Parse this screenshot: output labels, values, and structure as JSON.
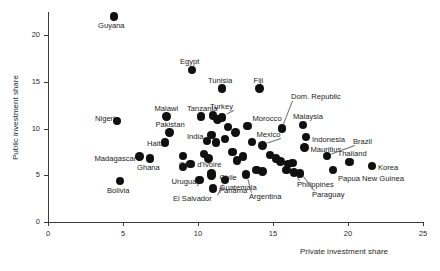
{
  "chart_data": {
    "type": "scatter",
    "title": "",
    "xlabel": "Private investment share",
    "ylabel": "Public investment share",
    "xlim": [
      0,
      25
    ],
    "ylim": [
      0,
      22.5
    ],
    "xticks": [
      0,
      5,
      10,
      15,
      20,
      25
    ],
    "yticks": [
      0,
      5,
      10,
      15,
      20
    ],
    "xtick_labels": [
      "0",
      "5",
      "10",
      "15",
      "20",
      "25"
    ],
    "ytick_labels": [
      "0",
      "5",
      "10",
      "15",
      "20"
    ],
    "grid": false,
    "legend": false,
    "points": [
      {
        "name": "Guyana",
        "x": 4.4,
        "y": 22.0,
        "label_dx": -16,
        "label_dy": 9,
        "leader": false
      },
      {
        "name": "Egypt",
        "x": 9.6,
        "y": 16.3,
        "label_dx": -12,
        "label_dy": -8,
        "leader": false
      },
      {
        "name": "Tunisia",
        "x": 11.6,
        "y": 14.3,
        "label_dx": -14,
        "label_dy": -8,
        "leader": false
      },
      {
        "name": "Fiji",
        "x": 14.1,
        "y": 14.3,
        "label_dx": -6,
        "label_dy": -8,
        "leader": false
      },
      {
        "name": "Dom. Republic",
        "x": 15.6,
        "y": 10.0,
        "label_dx": 9,
        "label_dy": -32,
        "leader": true
      },
      {
        "name": "Nigeria",
        "x": 4.6,
        "y": 10.8,
        "label_dx": -22,
        "label_dy": -2,
        "leader": false
      },
      {
        "name": "Malawi",
        "x": 7.9,
        "y": 11.3,
        "label_dx": -12,
        "label_dy": -8,
        "leader": false
      },
      {
        "name": "Tanzania",
        "x": 10.2,
        "y": 11.3,
        "label_dx": -14,
        "label_dy": -8,
        "leader": false
      },
      {
        "name": "Turkey",
        "x": 11.6,
        "y": 11.2,
        "label_dx": -12,
        "label_dy": -10,
        "leader": true
      },
      {
        "name": "Malaysia",
        "x": 17.0,
        "y": 10.4,
        "label_dx": -10,
        "label_dy": -8,
        "leader": false
      },
      {
        "name": "Morocco",
        "x": 13.3,
        "y": 10.3,
        "label_dx": 5,
        "label_dy": -7,
        "leader": false
      },
      {
        "name": "Indonesia",
        "x": 17.2,
        "y": 9.1,
        "label_dx": 6,
        "label_dy": 3,
        "leader": false
      },
      {
        "name": "Pakistan",
        "x": 8.1,
        "y": 9.6,
        "label_dx": -14,
        "label_dy": -7,
        "leader": false
      },
      {
        "name": "India",
        "x": 10.6,
        "y": 8.7,
        "label_dx": -20,
        "label_dy": -4,
        "leader": false
      },
      {
        "name": "Mexico",
        "x": 14.3,
        "y": 8.2,
        "label_dx": -6,
        "label_dy": -10,
        "leader": true
      },
      {
        "name": "Mauritius",
        "x": 17.1,
        "y": 8.0,
        "label_dx": 6,
        "label_dy": 3,
        "leader": false
      },
      {
        "name": "Brazil",
        "x": 18.6,
        "y": 7.1,
        "label_dx": 26,
        "label_dy": -14,
        "leader": true
      },
      {
        "name": "Haiti",
        "x": 7.8,
        "y": 8.5,
        "label_dx": -18,
        "label_dy": 1,
        "leader": false
      },
      {
        "name": "Madagascar",
        "x": 6.1,
        "y": 7.0,
        "label_dx": -45,
        "label_dy": 2,
        "leader": false
      },
      {
        "name": "Ghana",
        "x": 6.8,
        "y": 6.8,
        "label_dx": -13,
        "label_dy": 9,
        "leader": false
      },
      {
        "name": "Côte d'Ivoire",
        "x": 9.0,
        "y": 7.1,
        "label_dx": -4,
        "label_dy": 9,
        "leader": false
      },
      {
        "name": "Thailand",
        "x": 20.1,
        "y": 6.4,
        "label_dx": -12,
        "label_dy": -8,
        "leader": false
      },
      {
        "name": "Korea",
        "x": 21.6,
        "y": 6.0,
        "label_dx": 6,
        "label_dy": 2,
        "leader": false
      },
      {
        "name": "Papua New Guinea",
        "x": 19.0,
        "y": 5.6,
        "label_dx": 5,
        "label_dy": 9,
        "leader": false
      },
      {
        "name": "Philippines",
        "x": 16.4,
        "y": 5.3,
        "label_dx": 3,
        "label_dy": 12,
        "leader": true
      },
      {
        "name": "Paraguay",
        "x": 16.8,
        "y": 5.2,
        "label_dx": 12,
        "label_dy": 22,
        "leader": true
      },
      {
        "name": "Uruguay",
        "x": 10.1,
        "y": 4.5,
        "label_dx": -28,
        "label_dy": 2,
        "leader": false
      },
      {
        "name": "Chile",
        "x": 10.9,
        "y": 5.2,
        "label_dx": 8,
        "label_dy": 5,
        "leader": false
      },
      {
        "name": "Guatemala",
        "x": 10.9,
        "y": 5.0,
        "label_dx": 8,
        "label_dy": 13,
        "leader": false
      },
      {
        "name": "Panama",
        "x": 11.0,
        "y": 3.6,
        "label_dx": 6,
        "label_dy": 3,
        "leader": false
      },
      {
        "name": "Argentina",
        "x": 13.2,
        "y": 5.1,
        "label_dx": 3,
        "label_dy": 23,
        "leader": true
      },
      {
        "name": "El Salvador",
        "x": 11.8,
        "y": 4.5,
        "label_dx": -52,
        "label_dy": 19,
        "leader": true
      },
      {
        "name": "Bolivia",
        "x": 4.8,
        "y": 4.4,
        "label_dx": -13,
        "label_dy": 10,
        "leader": false
      }
    ],
    "extra_points": [
      {
        "x": 11.0,
        "y": 11.4
      },
      {
        "x": 11.3,
        "y": 11.0
      },
      {
        "x": 11.8,
        "y": 8.9
      },
      {
        "x": 11.2,
        "y": 8.5
      },
      {
        "x": 10.9,
        "y": 9.3
      },
      {
        "x": 10.4,
        "y": 7.3
      },
      {
        "x": 10.7,
        "y": 6.8
      },
      {
        "x": 12.3,
        "y": 7.5
      },
      {
        "x": 12.6,
        "y": 6.6
      },
      {
        "x": 13.0,
        "y": 7.0
      },
      {
        "x": 13.6,
        "y": 8.6
      },
      {
        "x": 14.8,
        "y": 7.2
      },
      {
        "x": 15.2,
        "y": 6.8
      },
      {
        "x": 15.5,
        "y": 6.5
      },
      {
        "x": 16.0,
        "y": 6.2
      },
      {
        "x": 16.3,
        "y": 6.3
      },
      {
        "x": 9.5,
        "y": 6.2
      },
      {
        "x": 9.0,
        "y": 5.9
      },
      {
        "x": 13.9,
        "y": 5.6
      },
      {
        "x": 14.3,
        "y": 5.4
      },
      {
        "x": 15.9,
        "y": 5.6
      },
      {
        "x": 12.5,
        "y": 9.6
      },
      {
        "x": 12.0,
        "y": 10.2
      }
    ]
  }
}
